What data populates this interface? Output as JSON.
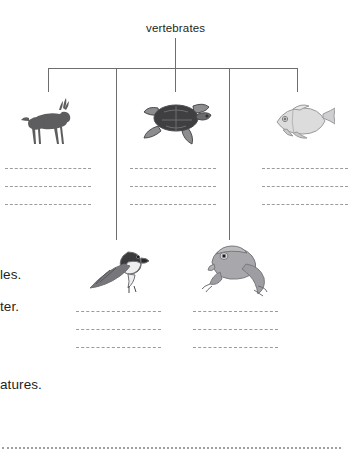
{
  "page": {
    "width": 343,
    "height": 459,
    "background": "#ffffff",
    "ink_color": "#231f20",
    "rule_color": "#6d6e70",
    "dash_color": "#9b9b9f"
  },
  "diagram": {
    "type": "classification-tree",
    "root": {
      "label": "vertebrates"
    },
    "branches": [
      {
        "id": "mammals",
        "icon": "antelope-icon",
        "row": 1,
        "answer_lines": 3
      },
      {
        "id": "reptiles",
        "icon": "turtle-icon",
        "row": 1,
        "answer_lines": 3
      },
      {
        "id": "fish",
        "icon": "fish-icon",
        "row": 1,
        "answer_lines": 3
      },
      {
        "id": "birds",
        "icon": "bird-icon",
        "row": 2,
        "answer_lines": 3
      },
      {
        "id": "amphibians",
        "icon": "frog-icon",
        "row": 2,
        "answer_lines": 3
      }
    ]
  },
  "margin_text": {
    "fragment_1": "les.",
    "fragment_2": "ter.",
    "fragment_3": "atures."
  }
}
